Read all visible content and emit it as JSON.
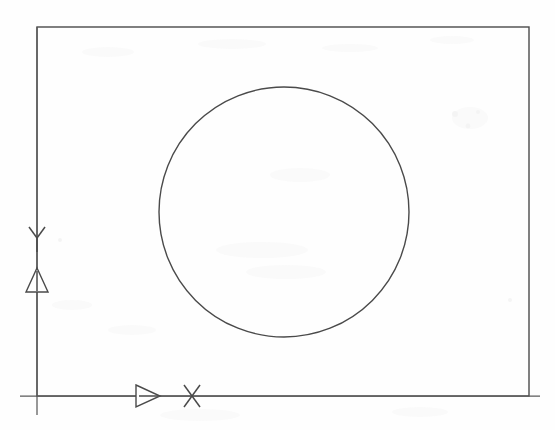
{
  "document": {
    "kind": "scanned-technical-drawing",
    "background_color": "#fefefe",
    "ink_color": "#4a4a4a",
    "width": 555,
    "height": 430
  },
  "frame": {
    "name": "drawing-border-rectangle",
    "x": 37,
    "y": 27,
    "width": 492,
    "height": 369
  },
  "circle": {
    "name": "primary-circle",
    "center_x": 284,
    "center_y": 212,
    "radius": 125
  },
  "axes": {
    "origin_x": 37,
    "origin_y": 396,
    "x_axis": {
      "label": "X",
      "label_x": 192,
      "label_y": 396,
      "line_start_x": 20,
      "line_end_x": 540,
      "line_y": 396,
      "arrow_tip_x": 160,
      "arrow_base_x": 136,
      "arrow_half_height": 11
    },
    "y_axis": {
      "label": "Y",
      "label_x": 37,
      "label_y": 238,
      "line_x": 37,
      "line_start_y": 27,
      "line_end_y": 415,
      "arrow_tip_y": 268,
      "arrow_base_y": 292,
      "arrow_half_width": 11
    }
  },
  "annotations": {
    "x_axis_marker_name": "x-axis-direction-arrow",
    "y_axis_marker_name": "y-axis-direction-arrow",
    "x_label_text": "X",
    "y_label_text": "Y"
  },
  "scan_artifacts": {
    "present": true,
    "description": "faint gray speckle and bleed-through ghosting across page"
  }
}
